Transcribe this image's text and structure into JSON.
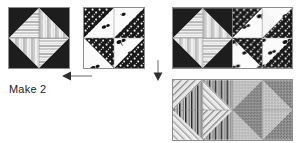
{
  "page": {
    "background_color": "#ffffff",
    "width": 301,
    "height": 143
  },
  "palette": {
    "dark": "#1d1d1d",
    "outline": "#8d8d8d",
    "light": "#f2f2f2",
    "mid_gray": "#9a9a9a",
    "text": "#1b1b1b",
    "arrow": "#3a3a3a"
  },
  "labels": {
    "make_two": "Make 2"
  },
  "arrows": [
    {
      "name": "arrow-left-to-make-two",
      "direction": "left",
      "x": 62,
      "y": 76,
      "length": 28
    },
    {
      "name": "arrow-down-to-bottom-unit",
      "direction": "down",
      "x": 157,
      "y": 62,
      "length": 17
    }
  ],
  "blocks": [
    {
      "name": "pinwheel-block-striped",
      "x": 8,
      "y": 7,
      "size": 62,
      "fabric_dark": "stripe-light",
      "fabric_light": "solid-dark",
      "description": "Pinwheel of four dark solid triangles alternating with four light striped triangles"
    },
    {
      "name": "pinwheel-block-dotted",
      "x": 83,
      "y": 7,
      "size": 62,
      "fabric_dark": "dot-dark",
      "fabric_light": "motif-white",
      "description": "Pinwheel of four dark dotted triangles alternating with four white triangles printed with small dark motifs"
    },
    {
      "name": "unit-top-left-striped",
      "x": 172,
      "y": 7,
      "size": 60,
      "fabric_dark": "stripe-light",
      "fabric_light": "solid-dark",
      "description": "Top row left pinwheel, striped fabric"
    },
    {
      "name": "unit-top-right-dotted",
      "x": 232,
      "y": 7,
      "size": 60,
      "fabric_dark": "dot-dark",
      "fabric_light": "motif-white",
      "description": "Top row right pinwheel, dotted fabric"
    },
    {
      "name": "unit-bottom-left-linework",
      "x": 172,
      "y": 79,
      "size": 60,
      "fabric_dark": "vertical-stripe",
      "fabric_light": "diagonal-hatch",
      "description": "Bottom row left pinwheel, vertical stripe and diagonal hatch"
    },
    {
      "name": "unit-bottom-right-texture",
      "x": 232,
      "y": 79,
      "size": 60,
      "fabric_dark": "gray-texture-dark",
      "fabric_light": "gray-texture-light",
      "description": "Bottom row right pinwheel, two gray textured fabrics"
    }
  ],
  "icons": {
    "arrow_left": "arrow-left-icon",
    "arrow_down": "arrow-down-icon"
  }
}
